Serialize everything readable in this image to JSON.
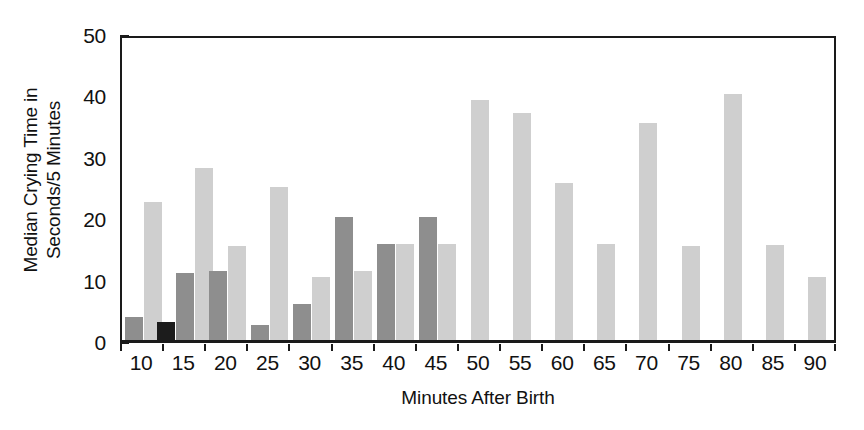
{
  "chart_data": {
    "type": "bar",
    "title": "",
    "xlabel": "Minutes After Birth",
    "ylabel": "Median Crying Time in Seconds/5 Minutes",
    "ylabel_lines": [
      "Median Crying Time in",
      "Seconds/5 Minutes"
    ],
    "grid": false,
    "legend_position": "none",
    "xlim_categories": [
      "10",
      "15",
      "20",
      "25",
      "30",
      "35",
      "40",
      "45",
      "50",
      "55",
      "60",
      "65",
      "70",
      "75",
      "80",
      "85",
      "90"
    ],
    "xtick_labels": [
      "10",
      "15",
      "20",
      "25",
      "30",
      "35",
      "40",
      "45",
      "50",
      "55",
      "60",
      "65",
      "70",
      "75",
      "80",
      "85",
      "90"
    ],
    "ylim": [
      0,
      50
    ],
    "ytick_labels": [
      "50",
      "40",
      "30",
      "20",
      "10",
      "0"
    ],
    "ytick_values": [
      50,
      40,
      30,
      20,
      10,
      0
    ],
    "series_colors": {
      "black": "#1c1c1c",
      "dark_gray": "#8e8e8e",
      "medium_gray": "#a8a8a8",
      "light_gray": "#cfcfcf"
    },
    "groups": [
      {
        "category": "10",
        "bars": [
          {
            "value": 3.7,
            "shade": "dark_gray"
          },
          {
            "value": 22.4,
            "shade": "light_gray"
          }
        ]
      },
      {
        "category": "15",
        "bars": [
          {
            "value": 3.0,
            "shade": "black"
          },
          {
            "value": 10.9,
            "shade": "dark_gray"
          },
          {
            "value": 28.0,
            "shade": "light_gray"
          }
        ]
      },
      {
        "category": "20",
        "bars": [
          {
            "value": 11.3,
            "shade": "dark_gray"
          },
          {
            "value": 15.3,
            "shade": "light_gray"
          }
        ]
      },
      {
        "category": "25",
        "bars": [
          {
            "value": 2.5,
            "shade": "dark_gray"
          },
          {
            "value": 25.0,
            "shade": "light_gray"
          }
        ]
      },
      {
        "category": "30",
        "bars": [
          {
            "value": 5.8,
            "shade": "dark_gray"
          },
          {
            "value": 10.2,
            "shade": "light_gray"
          }
        ]
      },
      {
        "category": "35",
        "bars": [
          {
            "value": 20.0,
            "shade": "dark_gray"
          },
          {
            "value": 11.2,
            "shade": "light_gray"
          }
        ]
      },
      {
        "category": "40",
        "bars": [
          {
            "value": 15.6,
            "shade": "dark_gray"
          },
          {
            "value": 15.6,
            "shade": "light_gray"
          }
        ]
      },
      {
        "category": "45",
        "bars": [
          {
            "value": 20.0,
            "shade": "dark_gray"
          },
          {
            "value": 15.6,
            "shade": "light_gray"
          }
        ]
      },
      {
        "category": "50",
        "bars": [
          {
            "value": 39.1,
            "shade": "light_gray"
          }
        ]
      },
      {
        "category": "55",
        "bars": [
          {
            "value": 37.0,
            "shade": "light_gray"
          }
        ]
      },
      {
        "category": "60",
        "bars": [
          {
            "value": 25.6,
            "shade": "light_gray"
          }
        ]
      },
      {
        "category": "65",
        "bars": [
          {
            "value": 15.7,
            "shade": "light_gray"
          }
        ]
      },
      {
        "category": "70",
        "bars": [
          {
            "value": 35.3,
            "shade": "light_gray"
          }
        ]
      },
      {
        "category": "75",
        "bars": [
          {
            "value": 15.3,
            "shade": "light_gray"
          }
        ]
      },
      {
        "category": "80",
        "bars": [
          {
            "value": 40.0,
            "shade": "light_gray"
          }
        ]
      },
      {
        "category": "85",
        "bars": [
          {
            "value": 15.5,
            "shade": "light_gray"
          }
        ]
      },
      {
        "category": "90",
        "bars": [
          {
            "value": 10.2,
            "shade": "light_gray"
          }
        ]
      }
    ]
  }
}
